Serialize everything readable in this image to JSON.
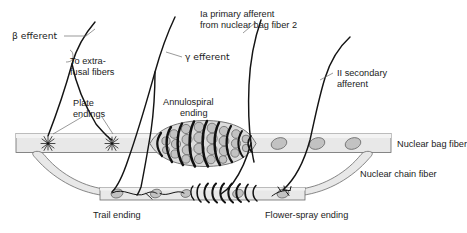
{
  "figure": {
    "background_color": "#ffffff",
    "width": 467,
    "height": 233
  },
  "colors": {
    "text": "#1b1b1b",
    "leader_line": "#6f6f6f",
    "nerve_fiber": "#141414",
    "muscle_fiber_fill": "#e8e8e8",
    "muscle_fiber_stroke": "#6a6a6a",
    "nucleus_fill": "#c2c2c2",
    "bulge_fill": "#dcdcdc",
    "spiral_band": "#111111"
  },
  "labels": {
    "beta_efferent": "β efferent",
    "to_extrafusal_1": "To extra-",
    "to_extrafusal_2": "fusal fibers",
    "plate_endings_1": "Plate",
    "plate_endings_2": "endings",
    "gamma_efferent": "γ efferent",
    "annulospiral_1": "Annulospiral",
    "annulospiral_2": "ending",
    "ia_primary_1": "Ia primary afferent",
    "ia_primary_2": "from nuclear bag fiber 2",
    "ii_secondary_1": "II secondary",
    "ii_secondary_2": "afferent",
    "nuclear_bag_fiber": "Nuclear bag fiber",
    "nuclear_chain_fiber": "Nuclear chain fiber",
    "trail_ending": "Trail ending",
    "flower_spray_ending": "Flower-spray ending"
  },
  "structures": {
    "nuclear_bag_fiber": {
      "name": "Nuclear bag fiber",
      "orientation": "horizontal",
      "nuclei_count": 3,
      "has_annulospiral_bulge": true,
      "plate_ending_count": 2
    },
    "nuclear_chain_fiber": {
      "name": "Nuclear chain fiber",
      "orientation": "horizontal-lower",
      "nuclei_count": 3,
      "spiral_coil_count": 9,
      "has_trail_ending": true,
      "has_flower_spray_ending": true
    },
    "nerve_fibers": [
      {
        "name": "β efferent",
        "target": "Plate endings / extrafusal fibers"
      },
      {
        "name": "γ efferent",
        "target": "Trail ending on nuclear chain fiber"
      },
      {
        "name": "Ia primary afferent",
        "target": "Annulospiral ending on nuclear bag fiber 2"
      },
      {
        "name": "II secondary afferent",
        "target": "Flower-spray ending on nuclear chain fiber"
      }
    ]
  }
}
